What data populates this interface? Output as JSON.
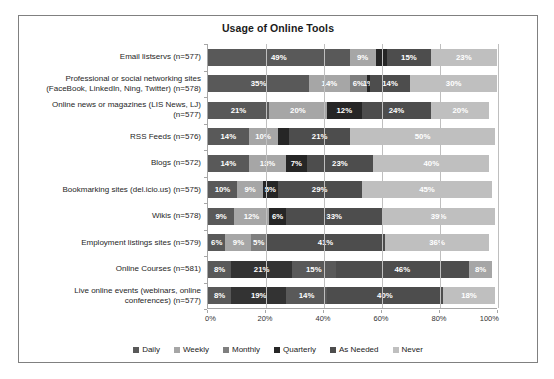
{
  "chart_data": {
    "type": "bar",
    "orientation": "horizontal",
    "stacked": true,
    "stack_mode": "percent",
    "title": "Usage of Online Tools",
    "xlabel": "",
    "ylabel": "",
    "xlim": [
      0,
      100
    ],
    "xticks": [
      "0%",
      "20%",
      "40%",
      "60%",
      "80%",
      "100%"
    ],
    "xtick_values": [
      0,
      20,
      40,
      60,
      80,
      100
    ],
    "grid": true,
    "legend_position": "bottom",
    "legend": [
      "Daily",
      "Weekly",
      "Monthly",
      "Quarterly",
      "As Needed",
      "Never"
    ],
    "colors": [
      "#595959",
      "#a6a6a6",
      "#7f7f7f",
      "#262626",
      "#4d4d4d",
      "#bfbfbf"
    ],
    "categories": [
      "Email listservs (n=577)",
      "Professional or social networking sites (FaceBook, LinkedIn, Ning, Twitter) (n=578)",
      "Online news or magazines (LIS News, LJ) (n=577)",
      "RSS Feeds (n=576)",
      "Blogs (n=572)",
      "Bookmarking sites (del.icio.us) (n=575)",
      "Wikis (n=578)",
      "Employment listings sites (n=579)",
      "Online Courses (n=581)",
      "Live online events (webinars, online conferences) (n=577)"
    ],
    "series": [
      {
        "name": "Daily",
        "values": [
          49,
          35,
          21,
          14,
          14,
          10,
          9,
          6,
          8,
          8
        ]
      },
      {
        "name": "Weekly",
        "values": [
          9,
          14,
          20,
          10,
          13,
          9,
          12,
          9,
          21,
          19
        ]
      },
      {
        "name": "Monthly",
        "values": [
          0,
          6,
          0,
          0,
          0,
          0,
          0,
          0,
          0,
          0
        ]
      },
      {
        "name": "Quarterly",
        "values": [
          4,
          1,
          12,
          4,
          7,
          5,
          6,
          5,
          15,
          14
        ]
      },
      {
        "name": "As Needed",
        "values": [
          15,
          14,
          24,
          21,
          23,
          29,
          33,
          41,
          46,
          40
        ]
      },
      {
        "name": "Never",
        "values": [
          23,
          30,
          20,
          50,
          40,
          45,
          39,
          36,
          8,
          18
        ]
      }
    ]
  },
  "rows": [
    {
      "label_lines": [
        "Email listservs (n=577)"
      ],
      "segments": [
        {
          "value": 49,
          "label": "49%",
          "color": "#595959",
          "show_label": true
        },
        {
          "value": 9,
          "label": "9%",
          "color": "#a6a6a6",
          "show_label": true
        },
        {
          "value": 4,
          "label": "4%",
          "color": "#262626",
          "show_label": false
        },
        {
          "value": 15,
          "label": "15%",
          "color": "#4d4d4d",
          "show_label": true
        },
        {
          "value": 23,
          "label": "23%",
          "color": "#bfbfbf",
          "show_label": true
        }
      ]
    },
    {
      "label_lines": [
        "Professional or social networking sites",
        "(FaceBook, LinkedIn, Ning, Twitter) (n=578)"
      ],
      "segments": [
        {
          "value": 35,
          "label": "35%",
          "color": "#595959",
          "show_label": true
        },
        {
          "value": 14,
          "label": "14%",
          "color": "#a6a6a6",
          "show_label": true
        },
        {
          "value": 6,
          "label": "6%",
          "color": "#7f7f7f",
          "show_label": true
        },
        {
          "value": 1,
          "label": "1%",
          "color": "#262626",
          "show_label": true
        },
        {
          "value": 14,
          "label": "14%",
          "color": "#4d4d4d",
          "show_label": true
        },
        {
          "value": 30,
          "label": "30%",
          "color": "#bfbfbf",
          "show_label": true
        }
      ]
    },
    {
      "label_lines": [
        "Online news or magazines (LIS News, LJ)",
        "(n=577)"
      ],
      "segments": [
        {
          "value": 21,
          "label": "21%",
          "color": "#595959",
          "show_label": true
        },
        {
          "value": 20,
          "label": "20%",
          "color": "#a6a6a6",
          "show_label": true
        },
        {
          "value": 12,
          "label": "12%",
          "color": "#262626",
          "show_label": true
        },
        {
          "value": 24,
          "label": "24%",
          "color": "#4d4d4d",
          "show_label": true
        },
        {
          "value": 20,
          "label": "20%",
          "color": "#bfbfbf",
          "show_label": true
        }
      ]
    },
    {
      "label_lines": [
        "RSS Feeds (n=576)"
      ],
      "segments": [
        {
          "value": 14,
          "label": "14%",
          "color": "#595959",
          "show_label": true
        },
        {
          "value": 10,
          "label": "10%",
          "color": "#a6a6a6",
          "show_label": true
        },
        {
          "value": 4,
          "label": "4%",
          "color": "#262626",
          "show_label": false
        },
        {
          "value": 21,
          "label": "21%",
          "color": "#4d4d4d",
          "show_label": true
        },
        {
          "value": 50,
          "label": "50%",
          "color": "#bfbfbf",
          "show_label": true
        }
      ]
    },
    {
      "label_lines": [
        "Blogs (n=572)"
      ],
      "segments": [
        {
          "value": 14,
          "label": "14%",
          "color": "#595959",
          "show_label": true
        },
        {
          "value": 13,
          "label": "13%",
          "color": "#a6a6a6",
          "show_label": true
        },
        {
          "value": 7,
          "label": "7%",
          "color": "#262626",
          "show_label": true
        },
        {
          "value": 23,
          "label": "23%",
          "color": "#4d4d4d",
          "show_label": true
        },
        {
          "value": 40,
          "label": "40%",
          "color": "#bfbfbf",
          "show_label": true
        }
      ]
    },
    {
      "label_lines": [
        "Bookmarking sites (del.icio.us) (n=575)"
      ],
      "segments": [
        {
          "value": 10,
          "label": "10%",
          "color": "#595959",
          "show_label": true
        },
        {
          "value": 9,
          "label": "9%",
          "color": "#a6a6a6",
          "show_label": true
        },
        {
          "value": 5,
          "label": "5%",
          "color": "#262626",
          "show_label": true
        },
        {
          "value": 29,
          "label": "29%",
          "color": "#4d4d4d",
          "show_label": true
        },
        {
          "value": 45,
          "label": "45%",
          "color": "#bfbfbf",
          "show_label": true
        }
      ]
    },
    {
      "label_lines": [
        "Wikis (n=578)"
      ],
      "segments": [
        {
          "value": 9,
          "label": "9%",
          "color": "#595959",
          "show_label": true
        },
        {
          "value": 12,
          "label": "12%",
          "color": "#a6a6a6",
          "show_label": true
        },
        {
          "value": 6,
          "label": "6%",
          "color": "#262626",
          "show_label": true
        },
        {
          "value": 33,
          "label": "33%",
          "color": "#4d4d4d",
          "show_label": true
        },
        {
          "value": 39,
          "label": "39%",
          "color": "#bfbfbf",
          "show_label": true
        }
      ]
    },
    {
      "label_lines": [
        "Employment listings sites (n=579)"
      ],
      "segments": [
        {
          "value": 6,
          "label": "6%",
          "color": "#595959",
          "show_label": true
        },
        {
          "value": 9,
          "label": "9%",
          "color": "#a6a6a6",
          "show_label": true
        },
        {
          "value": 5,
          "label": "5%",
          "color": "#7f7f7f",
          "show_label": true
        },
        {
          "value": 41,
          "label": "41%",
          "color": "#4d4d4d",
          "show_label": true
        },
        {
          "value": 36,
          "label": "36%",
          "color": "#bfbfbf",
          "show_label": true
        }
      ]
    },
    {
      "label_lines": [
        "Online Courses (n=581)"
      ],
      "segments": [
        {
          "value": 8,
          "label": "8%",
          "color": "#595959",
          "show_label": true
        },
        {
          "value": 21,
          "label": "21%",
          "color": "#333333",
          "show_label": true
        },
        {
          "value": 15,
          "label": "15%",
          "color": "#595959",
          "show_label": true
        },
        {
          "value": 46,
          "label": "46%",
          "color": "#4d4d4d",
          "show_label": true
        },
        {
          "value": 8,
          "label": "8%",
          "color": "#a6a6a6",
          "show_label": true
        }
      ]
    },
    {
      "label_lines": [
        "Live online events (webinars, online",
        "conferences) (n=577)"
      ],
      "segments": [
        {
          "value": 8,
          "label": "8%",
          "color": "#595959",
          "show_label": true
        },
        {
          "value": 19,
          "label": "19%",
          "color": "#333333",
          "show_label": true
        },
        {
          "value": 14,
          "label": "14%",
          "color": "#595959",
          "show_label": true
        },
        {
          "value": 40,
          "label": "40%",
          "color": "#4d4d4d",
          "show_label": true
        },
        {
          "value": 18,
          "label": "18%",
          "color": "#bfbfbf",
          "show_label": true
        }
      ]
    }
  ],
  "legend": {
    "items": [
      {
        "label": "Daily",
        "color": "#595959"
      },
      {
        "label": "Weekly",
        "color": "#a6a6a6"
      },
      {
        "label": "Monthly",
        "color": "#7f7f7f"
      },
      {
        "label": "Quarterly",
        "color": "#262626"
      },
      {
        "label": "As Needed",
        "color": "#4d4d4d"
      },
      {
        "label": "Never",
        "color": "#bfbfbf"
      }
    ]
  },
  "xaxis": {
    "ticks": [
      "0%",
      "20%",
      "40%",
      "60%",
      "80%",
      "100%"
    ]
  }
}
